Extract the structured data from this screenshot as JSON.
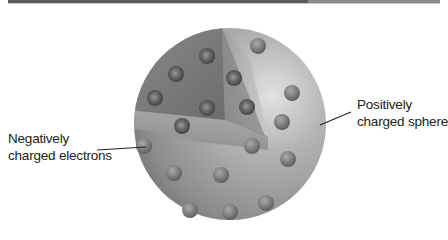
{
  "diagram": {
    "labels": {
      "electrons_line1": "Negatively",
      "electrons_line2": "charged electrons",
      "sphere_line1": "Positively",
      "sphere_line2": "charged sphere"
    },
    "colors": {
      "sphere_light": "#dcdcdc",
      "sphere_dark": "#6e6e6e",
      "cutaway_dark": "#7a7a7a",
      "electron": "#808080",
      "electron_inner": "#555555",
      "leader_line": "#222222",
      "top_bar": "#5a5a5a"
    },
    "sphere": {
      "cx": 230,
      "cy": 124,
      "r": 96
    },
    "interior_electrons": [
      {
        "x": 207,
        "y": 56
      },
      {
        "x": 176,
        "y": 74
      },
      {
        "x": 234,
        "y": 78
      },
      {
        "x": 155,
        "y": 98
      },
      {
        "x": 207,
        "y": 108
      },
      {
        "x": 247,
        "y": 107
      },
      {
        "x": 182,
        "y": 126
      }
    ],
    "surface_electrons": [
      {
        "x": 258,
        "y": 46
      },
      {
        "x": 292,
        "y": 93
      },
      {
        "x": 282,
        "y": 122
      },
      {
        "x": 252,
        "y": 146
      },
      {
        "x": 288,
        "y": 159
      },
      {
        "x": 144,
        "y": 146
      },
      {
        "x": 174,
        "y": 173
      },
      {
        "x": 221,
        "y": 175
      },
      {
        "x": 190,
        "y": 210
      },
      {
        "x": 230,
        "y": 212
      },
      {
        "x": 266,
        "y": 203
      }
    ]
  }
}
